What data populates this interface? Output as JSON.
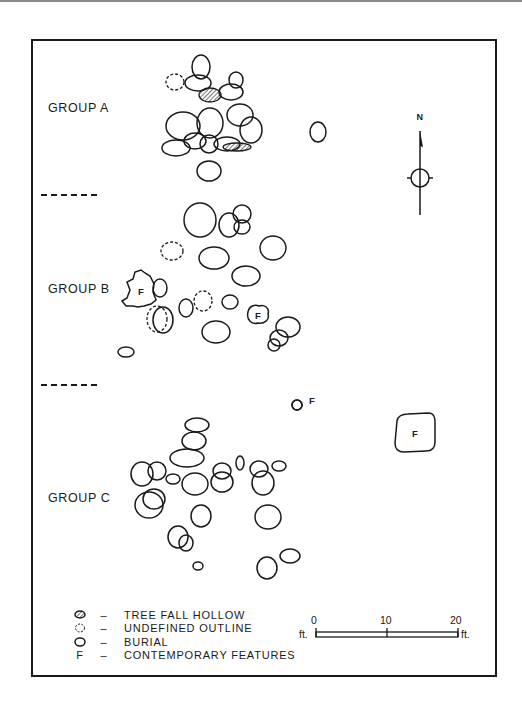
{
  "groups": [
    {
      "label": "GROUP A",
      "x": 48,
      "y": 101
    },
    {
      "label": "GROUP B",
      "x": 48,
      "y": 282
    },
    {
      "label": "GROUP C",
      "x": 48,
      "y": 491
    }
  ],
  "dividers": [
    {
      "x": 41,
      "y": 194
    },
    {
      "x": 41,
      "y": 384
    }
  ],
  "north_arrow": {
    "label": "N",
    "x": 420,
    "y": 110
  },
  "legend": {
    "items": [
      {
        "icon": "hatched-oval-icon",
        "label": "TREE FALL HOLLOW"
      },
      {
        "icon": "dashed-circle-icon",
        "label": "UNDEFINED OUTLINE"
      },
      {
        "icon": "oval-icon",
        "label": "BURIAL"
      },
      {
        "icon": "letter-f-icon",
        "glyph": "F",
        "label": "CONTEMPORARY FEATURES"
      }
    ],
    "dash": "–"
  },
  "scale_bar": {
    "ticks": [
      "0",
      "10",
      "20"
    ],
    "unit_left": "ft.",
    "unit_right": "ft.",
    "length_ft": 20
  },
  "features": {
    "burials": [
      [
        201,
        67,
        9,
        12
      ],
      [
        198,
        83,
        13,
        8
      ],
      [
        236,
        80,
        7,
        8
      ],
      [
        231,
        92,
        12,
        8
      ],
      [
        183,
        126,
        17,
        14
      ],
      [
        210,
        123,
        13,
        15
      ],
      [
        240,
        115,
        13,
        11
      ],
      [
        251,
        130,
        11,
        13
      ],
      [
        195,
        141,
        11,
        8
      ],
      [
        176,
        148,
        14,
        8
      ],
      [
        209,
        144,
        9,
        9
      ],
      [
        227,
        144,
        13,
        7
      ],
      [
        209,
        171,
        12,
        10
      ],
      [
        318,
        132,
        8,
        10
      ],
      [
        200,
        220,
        16,
        17
      ],
      [
        229,
        225,
        10,
        12
      ],
      [
        242,
        214,
        9,
        9
      ],
      [
        242,
        227,
        8,
        7
      ],
      [
        273,
        248,
        13,
        12
      ],
      [
        214,
        258,
        15,
        11
      ],
      [
        246,
        276,
        14,
        10
      ],
      [
        160,
        288,
        7,
        9
      ],
      [
        186,
        308,
        7,
        9
      ],
      [
        230,
        302,
        8,
        7
      ],
      [
        163,
        320,
        10,
        13
      ],
      [
        216,
        332,
        14,
        11
      ],
      [
        288,
        327,
        12,
        10
      ],
      [
        279,
        338,
        9,
        8
      ],
      [
        274,
        345,
        6,
        6
      ],
      [
        126,
        352,
        8,
        5
      ],
      [
        197,
        425,
        12,
        7
      ],
      [
        194,
        441,
        12,
        9
      ],
      [
        187,
        458,
        17,
        9
      ],
      [
        142,
        474,
        11,
        12
      ],
      [
        157,
        471,
        9,
        9
      ],
      [
        173,
        479,
        7,
        5
      ],
      [
        195,
        484,
        13,
        11
      ],
      [
        222,
        471,
        9,
        8
      ],
      [
        222,
        482,
        11,
        10
      ],
      [
        240,
        463,
        4,
        7
      ],
      [
        259,
        469,
        9,
        8
      ],
      [
        263,
        483,
        11,
        12
      ],
      [
        279,
        466,
        7,
        5
      ],
      [
        149,
        505,
        14,
        13
      ],
      [
        154,
        499,
        11,
        10
      ],
      [
        201,
        516,
        10,
        11
      ],
      [
        268,
        517,
        13,
        12
      ],
      [
        178,
        537,
        10,
        11
      ],
      [
        186,
        543,
        7,
        8
      ],
      [
        198,
        566,
        5,
        4
      ],
      [
        267,
        568,
        10,
        11
      ],
      [
        290,
        556,
        10,
        7
      ],
      [
        297,
        405,
        5,
        5
      ]
    ],
    "undefined_outlines": [
      [
        175,
        82,
        9,
        8
      ],
      [
        172,
        251,
        11,
        9
      ],
      [
        203,
        301,
        9,
        10
      ],
      [
        157,
        319,
        10,
        13
      ]
    ],
    "tree_fall_hollows": [
      [
        210,
        95,
        11,
        7
      ],
      [
        237,
        147,
        14,
        4
      ]
    ],
    "contemporary": [
      {
        "label": "F",
        "shape": "irregular",
        "x": 141,
        "y": 291
      },
      {
        "label": "F",
        "shape": "blob",
        "x": 258,
        "y": 315
      },
      {
        "label": "F",
        "shape": "small-circle",
        "x": 309,
        "y": 404
      },
      {
        "label": "F",
        "shape": "rounded-square",
        "x": 415,
        "y": 433
      }
    ]
  }
}
